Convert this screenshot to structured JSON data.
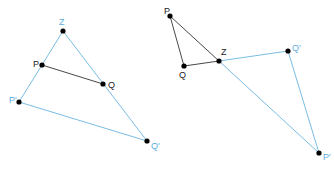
{
  "colors": {
    "original": "#333333",
    "image": "#6ab4e0",
    "image_label": "#5aaee0",
    "point": "#000000"
  },
  "figures": [
    {
      "id": "enlargement",
      "points": {
        "Z": {
          "label": "Z",
          "x": 63,
          "y": 31,
          "kind": "center"
        },
        "P": {
          "label": "P",
          "x": 42,
          "y": 65,
          "kind": "original"
        },
        "Q": {
          "label": "Q",
          "x": 103,
          "y": 84,
          "kind": "original"
        },
        "P1": {
          "label": "P'",
          "x": 19,
          "y": 102,
          "kind": "image"
        },
        "Q1": {
          "label": "Q'",
          "x": 147,
          "y": 141,
          "kind": "image"
        }
      },
      "segments": [
        {
          "from": "P",
          "to": "Q",
          "style": "original"
        },
        {
          "from": "Z",
          "to": "P1",
          "style": "image"
        },
        {
          "from": "Z",
          "to": "Q1",
          "style": "image"
        },
        {
          "from": "P1",
          "to": "Q1",
          "style": "image"
        }
      ]
    },
    {
      "id": "negative-enlargement",
      "points": {
        "P": {
          "label": "P",
          "x": 170,
          "y": 16,
          "kind": "original"
        },
        "Q": {
          "label": "Q",
          "x": 184,
          "y": 66,
          "kind": "original"
        },
        "Z": {
          "label": "Z",
          "x": 219,
          "y": 61,
          "kind": "center"
        },
        "Q1": {
          "label": "Q'",
          "x": 288,
          "y": 51,
          "kind": "image"
        },
        "P1": {
          "label": "P'",
          "x": 319,
          "y": 153,
          "kind": "image"
        }
      },
      "segments": [
        {
          "from": "P",
          "to": "Q",
          "style": "original"
        },
        {
          "from": "P",
          "to": "Z",
          "style": "original"
        },
        {
          "from": "Q",
          "to": "Z",
          "style": "original"
        },
        {
          "from": "Z",
          "to": "Q1",
          "style": "image"
        },
        {
          "from": "Z",
          "to": "P1",
          "style": "image"
        },
        {
          "from": "Q1",
          "to": "P1",
          "style": "image"
        }
      ]
    }
  ]
}
